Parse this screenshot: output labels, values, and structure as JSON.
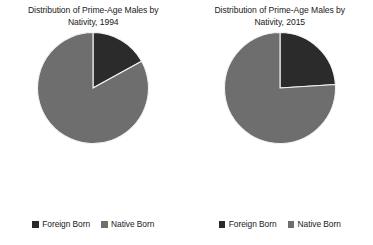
{
  "chart_data": [
    {
      "type": "pie",
      "title": "Distribution of Prime-Age Males by Nativity, 1994",
      "title_line1": "Distribution of Prime-Age Males by",
      "title_line2": "Nativity, 1994",
      "year": "1994",
      "categories": [
        "Foreign Born",
        "Native Born"
      ],
      "values": [
        17,
        83
      ],
      "colors": [
        "#2b2b2b",
        "#6e6e6e"
      ],
      "start_angle_deg": 0,
      "direction": "clockwise",
      "legend_position": "bottom",
      "slices": [
        {
          "label": "Foreign Born",
          "value": 17,
          "color": "#2b2b2b"
        },
        {
          "label": "Native Born",
          "value": 83,
          "color": "#6e6e6e"
        }
      ]
    },
    {
      "type": "pie",
      "title": "Distribution of Prime-Age Males by Nativity, 2015",
      "title_line1": "Distribution of Prime-Age Males by",
      "title_line2": "Nativity, 2015",
      "year": "2015",
      "categories": [
        "Foreign Born",
        "Native Born"
      ],
      "values": [
        24,
        76
      ],
      "colors": [
        "#2b2b2b",
        "#6e6e6e"
      ],
      "start_angle_deg": 0,
      "direction": "clockwise",
      "legend_position": "bottom",
      "slices": [
        {
          "label": "Foreign Born",
          "value": 24,
          "color": "#2b2b2b"
        },
        {
          "label": "Native Born",
          "value": 76,
          "color": "#6e6e6e"
        }
      ]
    }
  ],
  "panels": [
    {
      "title_line1": "Distribution of Prime-Age Males by",
      "title_line2": "Nativity, 1994",
      "legend": [
        {
          "label": "Foreign Born",
          "color": "#2b2b2b"
        },
        {
          "label": "Native Born",
          "color": "#6e6e6e"
        }
      ]
    },
    {
      "title_line1": "Distribution of Prime-Age Males by",
      "title_line2": "Nativity, 2015",
      "legend": [
        {
          "label": "Foreign Born",
          "color": "#2b2b2b"
        },
        {
          "label": "Native Born",
          "color": "#6e6e6e"
        }
      ]
    }
  ],
  "style": {
    "background": "#ffffff",
    "foreign_born_color": "#2b2b2b",
    "native_born_color": "#6e6e6e",
    "separator_color": "#f2f2f2"
  }
}
